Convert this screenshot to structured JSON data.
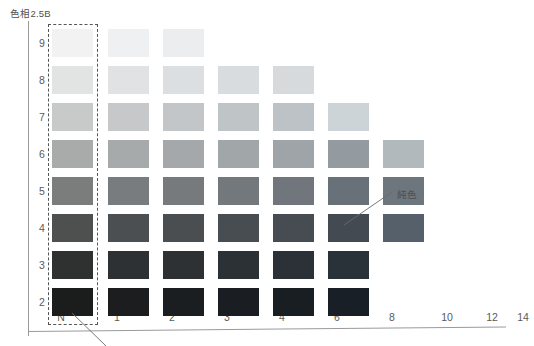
{
  "chart_data": {
    "type": "heatmap",
    "title": "色相2.5B",
    "xlabel": "",
    "ylabel": "",
    "grid": false,
    "legend_position": "none",
    "x_tick_labels": [
      "N",
      "1",
      "2",
      "3",
      "4",
      "6",
      "8",
      "10",
      "12",
      "14"
    ],
    "y_tick_labels": [
      "9",
      "8",
      "7",
      "6",
      "5",
      "4",
      "3",
      "2"
    ],
    "x_values": [
      0,
      1,
      2,
      3,
      4,
      6,
      8,
      10,
      12,
      14
    ],
    "y_values": [
      9,
      8,
      7,
      6,
      5,
      4,
      3,
      2
    ],
    "xlabel_name": "chroma",
    "ylabel_name": "value",
    "annotations": [
      {
        "text": "純色",
        "points_to_value": 4,
        "points_to_chroma": 8
      }
    ],
    "highlight_box": {
      "label": "N",
      "column": "N",
      "style": "dashed"
    },
    "rows": [
      {
        "value": "9",
        "cells": [
          {
            "chroma": "N",
            "color": "#f2f2f2"
          },
          {
            "chroma": "1",
            "color": "#eff0f1"
          },
          {
            "chroma": "2",
            "color": "#ebedee"
          }
        ]
      },
      {
        "value": "8",
        "cells": [
          {
            "chroma": "N",
            "color": "#e2e3e3"
          },
          {
            "chroma": "1",
            "color": "#e0e2e3"
          },
          {
            "chroma": "2",
            "color": "#dcdfe1"
          },
          {
            "chroma": "3",
            "color": "#d8dcdf"
          },
          {
            "chroma": "4",
            "color": "#d6dadd"
          }
        ]
      },
      {
        "value": "7",
        "cells": [
          {
            "chroma": "N",
            "color": "#c8c9c9"
          },
          {
            "chroma": "1",
            "color": "#c6c8c9"
          },
          {
            "chroma": "2",
            "color": "#c3c6c8"
          },
          {
            "chroma": "3",
            "color": "#bfc4c7"
          },
          {
            "chroma": "4",
            "color": "#bcc2c6"
          },
          {
            "chroma": "6",
            "color": "#cdd4d8"
          }
        ]
      },
      {
        "value": "6",
        "cells": [
          {
            "chroma": "N",
            "color": "#a9abab"
          },
          {
            "chroma": "1",
            "color": "#a7aaab"
          },
          {
            "chroma": "2",
            "color": "#a4a8aa"
          },
          {
            "chroma": "3",
            "color": "#a1a6a9"
          },
          {
            "chroma": "4",
            "color": "#9ea4a8"
          },
          {
            "chroma": "6",
            "color": "#939ba1"
          },
          {
            "chroma": "8",
            "color": "#b2b9bd"
          }
        ]
      },
      {
        "value": "5",
        "cells": [
          {
            "chroma": "N",
            "color": "#7b7d7d"
          },
          {
            "chroma": "1",
            "color": "#797c7e"
          },
          {
            "chroma": "2",
            "color": "#767a7d"
          },
          {
            "chroma": "3",
            "color": "#73787c"
          },
          {
            "chroma": "4",
            "color": "#70767b"
          },
          {
            "chroma": "6",
            "color": "#687079 ",
            "color_fixed": "#687079"
          },
          {
            "chroma": "8",
            "color": "#6d757d"
          }
        ]
      },
      {
        "value": "4",
        "cells": [
          {
            "chroma": "N",
            "color": "#4e5050"
          },
          {
            "chroma": "1",
            "color": "#4c4f51"
          },
          {
            "chroma": "2",
            "color": "#4a4e51"
          },
          {
            "chroma": "3",
            "color": "#484d51"
          },
          {
            "chroma": "4",
            "color": "#464c51"
          },
          {
            "chroma": "6",
            "color": "#434a52"
          },
          {
            "chroma": "8",
            "color": "#56606a"
          }
        ]
      },
      {
        "value": "3",
        "cells": [
          {
            "chroma": "N",
            "color": "#2f3131"
          },
          {
            "chroma": "1",
            "color": "#2e3133"
          },
          {
            "chroma": "2",
            "color": "#2d3134"
          },
          {
            "chroma": "3",
            "color": "#2c3135"
          },
          {
            "chroma": "4",
            "color": "#2b3136"
          },
          {
            "chroma": "6",
            "color": "#2a3239"
          }
        ]
      },
      {
        "value": "2",
        "cells": [
          {
            "chroma": "N",
            "color": "#1b1d1d"
          },
          {
            "chroma": "1",
            "color": "#1b1d1f"
          },
          {
            "chroma": "2",
            "color": "#1a1e20"
          },
          {
            "chroma": "3",
            "color": "#1a1e22"
          },
          {
            "chroma": "4",
            "color": "#191e23"
          },
          {
            "chroma": "6",
            "color": "#181f26"
          }
        ]
      }
    ]
  },
  "layout": {
    "col_x": {
      "N": 52,
      "1": 108,
      "2": 163,
      "3": 218,
      "4": 273,
      "6": 328,
      "8": 383
    },
    "row_y": {
      "9": 29,
      "8": 66,
      "7": 103,
      "6": 140,
      "5": 177,
      "4": 214,
      "3": 251,
      "2": 288
    },
    "y_tick_x": 33,
    "x_tick_x": {
      "N": 61,
      "1": 117,
      "2": 172,
      "3": 227,
      "4": 282,
      "6": 337,
      "8": 392,
      "10": 447,
      "12": 492,
      "14": 523
    }
  },
  "colors": {
    "axis": "#9a9a9a",
    "text": "#4f4f4f",
    "dashed_box_border": "#555555",
    "background": "#ffffff"
  }
}
